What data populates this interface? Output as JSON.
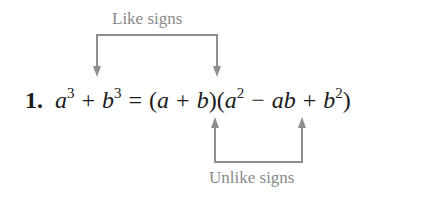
{
  "top_annotation": {
    "label": "Like signs"
  },
  "bottom_annotation": {
    "label": "Unlike signs"
  },
  "equation": {
    "number": "1.",
    "lhs": {
      "term1": {
        "base": "a",
        "exp": "3"
      },
      "op": "+",
      "term2": {
        "base": "b",
        "exp": "3"
      }
    },
    "equals": "=",
    "rhs": {
      "factor1": {
        "open": "(",
        "a": "a",
        "op": "+",
        "b": "b",
        "close": ")"
      },
      "factor2": {
        "open": "(",
        "t1": {
          "base": "a",
          "exp": "2"
        },
        "op1": "−",
        "t2": "ab",
        "op2": "+",
        "t3": {
          "base": "b",
          "exp": "2"
        },
        "close": ")"
      }
    }
  },
  "colors": {
    "annotation": "#8a8a8a",
    "text": "#1a1a1a"
  }
}
